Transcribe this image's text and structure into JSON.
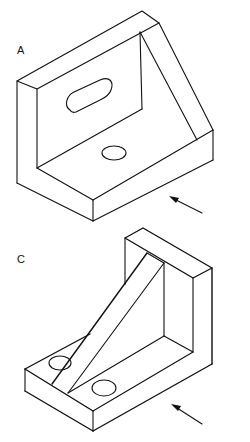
{
  "figures": [
    {
      "id": "A",
      "label": "A",
      "description": "Isometric view of angle bracket with triangular gusset, slotted hole in vertical plate and round hole in base",
      "features": [
        "vertical-plate",
        "base-plate",
        "triangular-gusset",
        "slot-hole",
        "round-hole",
        "view-direction-arrow"
      ]
    },
    {
      "id": "C",
      "label": "C",
      "description": "Isometric view of angle bracket with diagonal rib, two round holes in base plate",
      "features": [
        "vertical-plate",
        "base-plate",
        "diagonal-rib",
        "round-hole-left",
        "round-hole-right",
        "view-direction-arrow"
      ]
    }
  ],
  "colors": {
    "line": "#111111",
    "background": "#ffffff"
  }
}
